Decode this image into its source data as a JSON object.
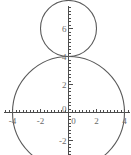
{
  "chart_data": {
    "type": "line",
    "title": "",
    "xlabel": "",
    "ylabel": "",
    "xlim": [
      -4.6,
      4.6
    ],
    "ylim": [
      -3.0,
      7.6
    ],
    "grid": false,
    "legend": null,
    "x_ticks_labeled": [
      {
        "value": -4,
        "label": "-4"
      },
      {
        "value": -2,
        "label": "-2"
      },
      {
        "value": 0,
        "label": "0"
      },
      {
        "value": 2,
        "label": "2"
      },
      {
        "value": 4,
        "label": "4"
      }
    ],
    "y_ticks_labeled": [
      {
        "value": -2,
        "label": "-2"
      },
      {
        "value": 0,
        "label": "0"
      },
      {
        "value": 2,
        "label": "2"
      },
      {
        "value": 4,
        "label": "4"
      },
      {
        "value": 6,
        "label": "6"
      }
    ],
    "x_minor_tick_step": 0.25,
    "y_minor_tick_step": 0.25,
    "series": [
      {
        "name": "large-circle",
        "shape": "circle",
        "center": [
          0,
          0
        ],
        "radius": 4,
        "values": []
      },
      {
        "name": "small-circle",
        "shape": "circle",
        "center": [
          0,
          6
        ],
        "radius": 2,
        "values": []
      }
    ],
    "annotations": []
  },
  "figure": {
    "background_color": "#ffffff",
    "axis_color": "#4d4d4d",
    "curve_color": "#5a5a5a",
    "label_color": "#6a6a6a"
  }
}
